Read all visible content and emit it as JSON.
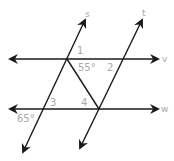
{
  "diagram": {
    "type": "parallel-lines-transversals",
    "colors": {
      "line": "#1a1a1a",
      "label": "#a8a8a8",
      "background": "#ffffff"
    },
    "lines": [
      {
        "name": "s",
        "label": "s",
        "x1": 23,
        "y1": 152,
        "x2": 85,
        "y2": 20
      },
      {
        "name": "t",
        "label": "t",
        "x1": 80,
        "y1": 148,
        "x2": 142,
        "y2": 20
      },
      {
        "name": "v",
        "label": "v",
        "x1": 10,
        "y1": 59,
        "x2": 158,
        "y2": 59
      },
      {
        "name": "w",
        "label": "w",
        "x1": 10,
        "y1": 109,
        "x2": 158,
        "y2": 109
      }
    ],
    "segment": {
      "name": "transversal-segment",
      "x1": 67,
      "y1": 59,
      "x2": 99,
      "y2": 109
    },
    "line_labels": {
      "s": "s",
      "t": "t",
      "v": "v",
      "w": "w"
    },
    "angle_labels": {
      "angle1": "1",
      "angle2": "2",
      "angle3": "3",
      "angle4": "4",
      "given55": "55°",
      "given65": "65°"
    }
  }
}
